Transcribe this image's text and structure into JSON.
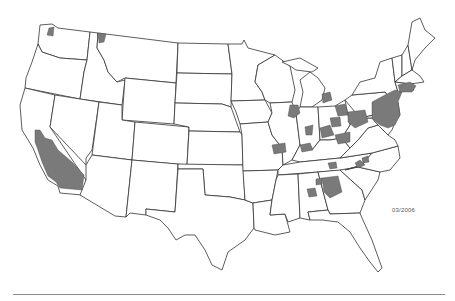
{
  "map": {
    "title": "",
    "region": "Contiguous United States",
    "type": "choropleth",
    "colors": {
      "background": "#ffffff",
      "state_border": "#333333",
      "highlighted_county": "#7a7a7a"
    },
    "highlighted_regions": [
      "Northwest Washington",
      "Northern Idaho",
      "Southern California (Central Valley / southern counties)",
      "Illinois",
      "Indiana",
      "Michigan",
      "Ohio",
      "Kentucky",
      "Pennsylvania",
      "West Virginia",
      "Virginia",
      "Maryland",
      "Delaware",
      "New Jersey",
      "New York",
      "Connecticut",
      "Massachusetts",
      "Tennessee",
      "North Carolina",
      "Georgia",
      "Alabama"
    ],
    "date_label": "03/2006"
  }
}
